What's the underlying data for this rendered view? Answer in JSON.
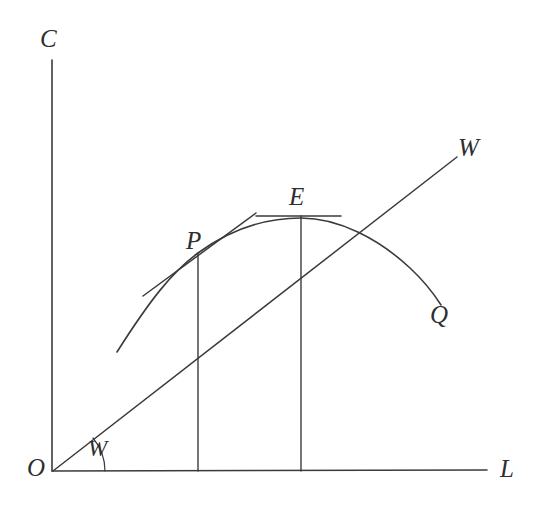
{
  "figure": {
    "type": "economics-diagram",
    "background_color": "#ffffff",
    "ink_color": "#3b3b3b",
    "axes": {
      "vertical": {
        "label": "C",
        "label_x": 40,
        "label_y": 26,
        "x": 52,
        "y_top": 60,
        "y_bottom": 471
      },
      "horizontal": {
        "label": "L",
        "label_x": 500,
        "label_y": 456,
        "y": 471,
        "x_left": 52,
        "x_right": 487
      },
      "origin": {
        "label": "O",
        "label_x": 27,
        "label_y": 455,
        "x": 52,
        "y": 471
      }
    },
    "curve": {
      "name": "production-curve",
      "start_label": null,
      "end_label": "Q",
      "end_label_x": 430,
      "end_label_y": 302,
      "path": "M 117 352 C 150 300 172 272 198 253 C 235 226 270 218 301 218 C 340 218 380 240 410 268 C 424 281 434 294 441 305",
      "start_point": [
        117,
        352
      ],
      "end_point": [
        441,
        305
      ]
    },
    "ray": {
      "name": "wage-ray",
      "label": "W",
      "label_x": 458,
      "label_y": 135,
      "from": [
        53,
        471
      ],
      "to": [
        457,
        157
      ],
      "slope_angle_degrees": 38
    },
    "angle": {
      "label": "W",
      "label_x": 88,
      "label_y": 437,
      "arc_path": "M 105 471 A 52 52 0 0 0 93 438"
    },
    "points": [
      {
        "id": "P",
        "label": "P",
        "label_x": 186,
        "label_y": 228,
        "x": 198,
        "y": 253,
        "drop_line": {
          "x": 198,
          "y_top": 253,
          "y_bottom": 471
        },
        "tangent": {
          "x1": 143,
          "y1": 296,
          "x2": 256,
          "y2": 213
        }
      },
      {
        "id": "E",
        "label": "E",
        "label_x": 289,
        "label_y": 184,
        "x": 301,
        "y": 218,
        "drop_line": {
          "x": 301,
          "y_top": 216,
          "y_bottom": 471
        },
        "tangent": {
          "x1": 256,
          "y1": 216,
          "x2": 341,
          "y2": 216
        }
      }
    ]
  }
}
